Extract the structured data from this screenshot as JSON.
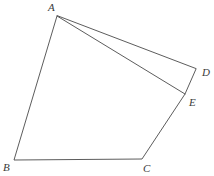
{
  "figure": {
    "background_color": "#ffffff",
    "stroke_color": "#4a4a4a",
    "label_color": "#3a3a3a",
    "width": 214,
    "height": 176,
    "vertices": [
      {
        "id": "A",
        "label": "A",
        "x": 57,
        "y": 16,
        "label_x": 48,
        "label_y": 2
      },
      {
        "id": "B",
        "label": "B",
        "x": 14,
        "y": 160,
        "label_x": 3,
        "label_y": 162
      },
      {
        "id": "C",
        "label": "C",
        "x": 142,
        "y": 159,
        "label_x": 143,
        "label_y": 163
      },
      {
        "id": "D",
        "label": "D",
        "x": 196,
        "y": 69,
        "label_x": 202,
        "label_y": 67
      },
      {
        "id": "E",
        "label": "E",
        "x": 185,
        "y": 94,
        "label_x": 189,
        "label_y": 97
      }
    ],
    "outline_path": "M 57 16 L 14 160 L 142 159 L 185 94 L 196 69 Z",
    "diagonal_path": "M 57 16 L 185 94",
    "edges": [
      {
        "name": "edge-A-B",
        "from": "A",
        "to": "B"
      },
      {
        "name": "edge-B-C",
        "from": "B",
        "to": "C"
      },
      {
        "name": "edge-C-E",
        "from": "C",
        "to": "E"
      },
      {
        "name": "edge-E-D",
        "from": "E",
        "to": "D"
      },
      {
        "name": "edge-D-A",
        "from": "D",
        "to": "A"
      },
      {
        "name": "diagonal-A-E",
        "from": "A",
        "to": "E"
      }
    ]
  }
}
